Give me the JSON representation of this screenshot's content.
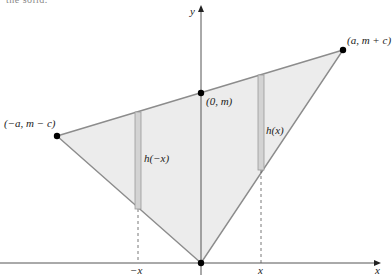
{
  "caption_fragment": "the solid.",
  "colors": {
    "triangle_fill": "#ececec",
    "triangle_stroke": "#8c8c8c",
    "strip_fill": "#d3d3d3",
    "strip_stroke": "#9a9a9a",
    "axis": "#555555",
    "point": "#000000",
    "dashed": "#555555"
  },
  "axes": {
    "x_label": "x",
    "y_label": "y",
    "origin": [
      201,
      263
    ],
    "x_end": [
      380,
      263
    ],
    "y_end": [
      201,
      6
    ]
  },
  "points": [
    {
      "id": "left-vertex",
      "label": "(−a, m − c)",
      "px": [
        57,
        136
      ]
    },
    {
      "id": "top-vertex",
      "label": "(a, m + c)",
      "px": [
        343,
        50
      ]
    },
    {
      "id": "y-intercept",
      "label": "(0, m)",
      "px": [
        201,
        93
      ]
    },
    {
      "id": "origin",
      "label": "",
      "px": [
        201,
        263
      ]
    }
  ],
  "strips": [
    {
      "id": "left-strip",
      "label": "h(−x)",
      "x_left": 135,
      "x_right": 141,
      "y_top": 112,
      "y_bottom": 209
    },
    {
      "id": "right-strip",
      "label": "h(x)",
      "x_left": 258,
      "x_right": 264,
      "y_top": 75,
      "y_bottom": 170
    }
  ],
  "ticks": [
    {
      "id": "tick-neg-x",
      "label": "−x",
      "x": 138
    },
    {
      "id": "tick-x",
      "label": "x",
      "x": 261
    }
  ],
  "labels": {
    "top_vertex": "(a, m + c)",
    "left_vertex": "(−a, m − c)",
    "y_intercept": "(0, m)",
    "h_neg_x": "h(−x)",
    "h_x": "h(x)",
    "tick_neg_x": "−x",
    "tick_x": "x",
    "x_axis": "x",
    "y_axis": "y"
  }
}
